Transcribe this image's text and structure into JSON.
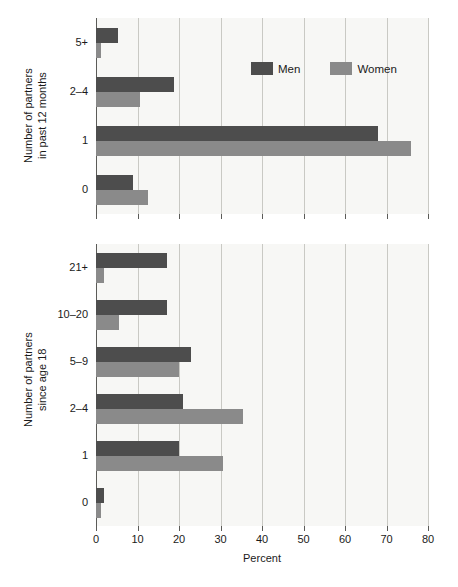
{
  "figure": {
    "xlabel": "Percent",
    "legend": {
      "men": "Men",
      "women": "Women"
    }
  },
  "axis": {
    "ticks": [
      "0",
      "10",
      "20",
      "30",
      "40",
      "50",
      "60",
      "70",
      "80"
    ]
  },
  "colors": {
    "men": "#4d4d4d",
    "women": "#8a8a8a",
    "plot_background": "#f7f7f5",
    "gridline": "#c9c9c4",
    "axis": "#5b5b58"
  },
  "chart_data": [
    {
      "type": "bar",
      "title": "",
      "orientation": "horizontal",
      "ylabel": "Number of partners\nin past 12 months",
      "xlabel": "Percent",
      "xlim": [
        0,
        80
      ],
      "xticks": [
        0,
        10,
        20,
        30,
        40,
        50,
        60,
        70,
        80
      ],
      "grid": true,
      "legend_position": "upper right inside",
      "categories": [
        "0",
        "1",
        "2–4",
        "5+"
      ],
      "series": [
        {
          "name": "Men",
          "values": [
            9.0,
            68.0,
            18.7,
            5.3
          ]
        },
        {
          "name": "Women",
          "values": [
            12.5,
            76.0,
            10.5,
            1.3
          ]
        }
      ]
    },
    {
      "type": "bar",
      "title": "",
      "orientation": "horizontal",
      "ylabel": "Number of partners\nsince age 18",
      "xlabel": "Percent",
      "xlim": [
        0,
        80
      ],
      "xticks": [
        0,
        10,
        20,
        30,
        40,
        50,
        60,
        70,
        80
      ],
      "grid": true,
      "legend_position": "none",
      "categories": [
        "0",
        "1",
        "2–4",
        "5–9",
        "10–20",
        "21+"
      ],
      "series": [
        {
          "name": "Men",
          "values": [
            2.0,
            20.0,
            21.0,
            23.0,
            17.0,
            17.0
          ]
        },
        {
          "name": "Women",
          "values": [
            1.3,
            30.5,
            35.5,
            20.0,
            5.5,
            2.0
          ]
        }
      ]
    }
  ],
  "panels": {
    "top": {
      "ytitle": "Number of partners\nin past 12 months",
      "ylabels": [
        "5+",
        "2–4",
        "1",
        "0"
      ]
    },
    "bottom": {
      "ytitle": "Number of partners\nsince age 18",
      "ylabels": [
        "21+",
        "10–20",
        "5–9",
        "2–4",
        "1",
        "0"
      ]
    }
  }
}
